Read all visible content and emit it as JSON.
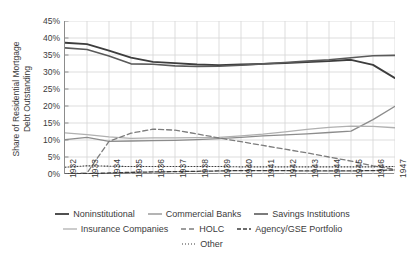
{
  "chart_data": {
    "type": "line",
    "title": "",
    "xlabel": "",
    "ylabel": "Share of Residential Mortgage\nDebt Outstanding",
    "x": [
      1932,
      1933,
      1934,
      1935,
      1936,
      1937,
      1938,
      1939,
      1940,
      1941,
      1942,
      1943,
      1944,
      1945,
      1946,
      1947
    ],
    "xticklabels": [
      "1932",
      "1933",
      "1934",
      "1935",
      "1936",
      "1937",
      "1938",
      "1939",
      "1940",
      "1941",
      "1942",
      "1943",
      "1944",
      "1945",
      "1946",
      "1947"
    ],
    "ylim": [
      0,
      45
    ],
    "yticks": [
      0,
      5,
      10,
      15,
      20,
      25,
      30,
      35,
      40,
      45
    ],
    "yticklabels": [
      "0%",
      "5%",
      "10%",
      "15%",
      "20%",
      "25%",
      "30%",
      "35%",
      "40%",
      "45%"
    ],
    "grid": true,
    "legend_position": "bottom",
    "series": [
      {
        "name": "Noninstitutional",
        "color": "#3d3d3d",
        "width": 1.8,
        "dash": "none",
        "values": [
          38.6,
          38.2,
          36.3,
          34.2,
          33.0,
          32.6,
          32.2,
          32.0,
          32.2,
          32.4,
          32.6,
          32.9,
          33.2,
          33.6,
          32.1,
          28.2
        ]
      },
      {
        "name": "Commercial Banks",
        "color": "#8c8c8c",
        "width": 1.3,
        "dash": "none",
        "values": [
          10.1,
          10.8,
          9.6,
          9.7,
          9.8,
          9.9,
          10.1,
          10.4,
          10.8,
          11.2,
          11.5,
          11.8,
          12.2,
          12.6,
          16.0,
          19.9
        ]
      },
      {
        "name": "Savings Institutions",
        "color": "#5a5a5a",
        "width": 1.6,
        "dash": "none",
        "values": [
          37.1,
          36.6,
          34.7,
          32.4,
          32.3,
          31.8,
          31.6,
          31.7,
          32.0,
          32.4,
          32.8,
          33.2,
          33.6,
          34.2,
          34.8,
          34.9
        ]
      },
      {
        "name": "Insurance Companies",
        "color": "#b0b0b0",
        "width": 1.3,
        "dash": "none",
        "values": [
          12.1,
          11.6,
          10.9,
          10.5,
          10.6,
          10.6,
          10.7,
          10.8,
          11.2,
          11.7,
          12.4,
          13.1,
          13.7,
          14.1,
          14.0,
          13.6
        ]
      },
      {
        "name": "HOLC",
        "color": "#7d7d7d",
        "width": 1.3,
        "dash": "5,3",
        "values": [
          0.0,
          0.3,
          9.6,
          12.0,
          13.2,
          12.9,
          11.8,
          10.6,
          9.5,
          8.4,
          7.3,
          6.2,
          5.0,
          3.8,
          2.4,
          1.4
        ]
      },
      {
        "name": "Agency/GSE Portfolio",
        "color": "#3d3d3d",
        "width": 1.3,
        "dash": "4,2",
        "values": [
          0.1,
          0.1,
          0.3,
          0.5,
          0.6,
          0.7,
          0.8,
          0.9,
          1.0,
          1.0,
          1.0,
          0.9,
          0.9,
          0.9,
          1.0,
          1.2
        ]
      },
      {
        "name": "Other",
        "color": "#3d3d3d",
        "width": 1.1,
        "dash": "1,2",
        "values": [
          2.0,
          2.4,
          2.3,
          2.2,
          2.2,
          2.2,
          2.2,
          2.2,
          2.1,
          2.1,
          2.1,
          2.1,
          2.1,
          2.1,
          2.1,
          2.2
        ]
      }
    ]
  }
}
